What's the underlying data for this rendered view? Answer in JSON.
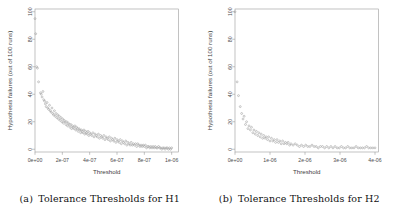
{
  "figure": {
    "panels": [
      {
        "id": "panel-h1",
        "caption_tag": "(a)",
        "caption_text": "Tolerance Thresholds for H1"
      },
      {
        "id": "panel-h2",
        "caption_tag": "(b)",
        "caption_text": "Tolerance Thresholds for H2"
      }
    ]
  },
  "chart_data": [
    {
      "type": "scatter",
      "title": "",
      "xlabel": "Threshold",
      "ylabel": "Hypothesis failures (out of 100 runs)",
      "xlim": [
        0,
        1.05e-06
      ],
      "ylim": [
        -2,
        102
      ],
      "grid": false,
      "legend": null,
      "xticks": [
        0,
        2e-07,
        4e-07,
        6e-07,
        8e-07,
        1e-06
      ],
      "xticklabels": [
        "0e+00",
        "2e-07",
        "4e-07",
        "6e-07",
        "8e-07",
        "1e-06"
      ],
      "yticks": [
        0,
        20,
        40,
        60,
        80,
        100
      ],
      "yticklabels": [
        "0",
        "20",
        "40",
        "60",
        "80",
        "100"
      ],
      "marker": "open-circle",
      "marker_color": "#9c9c9c",
      "points": [
        [
          0.0,
          95
        ],
        [
          5e-09,
          84
        ],
        [
          1.2e-08,
          60
        ],
        [
          1.8e-08,
          59
        ],
        [
          2.6e-08,
          49
        ],
        [
          4e-08,
          41
        ],
        [
          4.6e-08,
          40
        ],
        [
          5.2e-08,
          38
        ],
        [
          5.8e-08,
          42
        ],
        [
          6.4e-08,
          36
        ],
        [
          7e-08,
          35
        ],
        [
          7.6e-08,
          33
        ],
        [
          8.2e-08,
          31
        ],
        [
          8.8e-08,
          34
        ],
        [
          9.4e-08,
          30
        ],
        [
          1e-07,
          29
        ],
        [
          1.06e-07,
          32
        ],
        [
          1.12e-07,
          28
        ],
        [
          1.18e-07,
          27
        ],
        [
          1.24e-07,
          30
        ],
        [
          1.3e-07,
          26
        ],
        [
          1.36e-07,
          25
        ],
        [
          1.42e-07,
          28
        ],
        [
          1.48e-07,
          24
        ],
        [
          1.54e-07,
          26
        ],
        [
          1.6e-07,
          23
        ],
        [
          1.66e-07,
          25
        ],
        [
          1.72e-07,
          22
        ],
        [
          1.78e-07,
          24
        ],
        [
          1.84e-07,
          21
        ],
        [
          1.9e-07,
          23
        ],
        [
          1.96e-07,
          20
        ],
        [
          2.02e-07,
          22
        ],
        [
          2.08e-07,
          19
        ],
        [
          2.14e-07,
          21
        ],
        [
          2.2e-07,
          20
        ],
        [
          2.26e-07,
          18
        ],
        [
          2.32e-07,
          20
        ],
        [
          2.38e-07,
          17
        ],
        [
          2.44e-07,
          19
        ],
        [
          2.5e-07,
          18
        ],
        [
          2.56e-07,
          16
        ],
        [
          2.62e-07,
          18
        ],
        [
          2.68e-07,
          15
        ],
        [
          2.74e-07,
          17
        ],
        [
          2.8e-07,
          16
        ],
        [
          2.86e-07,
          15
        ],
        [
          2.92e-07,
          17
        ],
        [
          2.98e-07,
          14
        ],
        [
          3.04e-07,
          16
        ],
        [
          3.1e-07,
          15
        ],
        [
          3.16e-07,
          13
        ],
        [
          3.22e-07,
          15
        ],
        [
          3.28e-07,
          14
        ],
        [
          3.34e-07,
          12
        ],
        [
          3.4e-07,
          14
        ],
        [
          3.46e-07,
          13
        ],
        [
          3.52e-07,
          12
        ],
        [
          3.58e-07,
          14
        ],
        [
          3.64e-07,
          11
        ],
        [
          3.7e-07,
          13
        ],
        [
          3.76e-07,
          12
        ],
        [
          3.82e-07,
          11
        ],
        [
          3.88e-07,
          13
        ],
        [
          3.94e-07,
          10
        ],
        [
          4e-07,
          12
        ],
        [
          4.08e-07,
          11
        ],
        [
          4.16e-07,
          10
        ],
        [
          4.24e-07,
          12
        ],
        [
          4.32e-07,
          9
        ],
        [
          4.4e-07,
          11
        ],
        [
          4.48e-07,
          10
        ],
        [
          4.56e-07,
          9
        ],
        [
          4.64e-07,
          11
        ],
        [
          4.72e-07,
          8
        ],
        [
          4.8e-07,
          10
        ],
        [
          4.88e-07,
          9
        ],
        [
          4.96e-07,
          8
        ],
        [
          5.04e-07,
          10
        ],
        [
          5.12e-07,
          7
        ],
        [
          5.2e-07,
          9
        ],
        [
          5.28e-07,
          8
        ],
        [
          5.36e-07,
          7
        ],
        [
          5.44e-07,
          9
        ],
        [
          5.52e-07,
          6
        ],
        [
          5.6e-07,
          8
        ],
        [
          5.68e-07,
          7
        ],
        [
          5.76e-07,
          6
        ],
        [
          5.84e-07,
          8
        ],
        [
          5.92e-07,
          5
        ],
        [
          6e-07,
          7
        ],
        [
          6.08e-07,
          6
        ],
        [
          6.16e-07,
          5
        ],
        [
          6.24e-07,
          7
        ],
        [
          6.32e-07,
          4
        ],
        [
          6.4e-07,
          6
        ],
        [
          6.48e-07,
          5
        ],
        [
          6.56e-07,
          4
        ],
        [
          6.64e-07,
          6
        ],
        [
          6.72e-07,
          3
        ],
        [
          6.8e-07,
          5
        ],
        [
          6.88e-07,
          4
        ],
        [
          6.96e-07,
          3
        ],
        [
          7.04e-07,
          5
        ],
        [
          7.12e-07,
          3
        ],
        [
          7.2e-07,
          4
        ],
        [
          7.28e-07,
          3
        ],
        [
          7.36e-07,
          4
        ],
        [
          7.44e-07,
          2
        ],
        [
          7.52e-07,
          4
        ],
        [
          7.6e-07,
          3
        ],
        [
          7.68e-07,
          2
        ],
        [
          7.76e-07,
          3
        ],
        [
          7.84e-07,
          2
        ],
        [
          7.92e-07,
          3
        ],
        [
          8e-07,
          2
        ],
        [
          8.08e-07,
          3
        ],
        [
          8.16e-07,
          1
        ],
        [
          8.24e-07,
          2
        ],
        [
          8.32e-07,
          2
        ],
        [
          8.4e-07,
          1
        ],
        [
          8.48e-07,
          2
        ],
        [
          8.56e-07,
          1
        ],
        [
          8.64e-07,
          2
        ],
        [
          8.72e-07,
          1
        ],
        [
          8.8e-07,
          2
        ],
        [
          8.88e-07,
          1
        ],
        [
          8.96e-07,
          1
        ],
        [
          9.04e-07,
          2
        ],
        [
          9.12e-07,
          1
        ],
        [
          9.2e-07,
          1
        ],
        [
          9.28e-07,
          0
        ],
        [
          9.36e-07,
          1
        ],
        [
          9.44e-07,
          1
        ],
        [
          9.52e-07,
          0
        ],
        [
          9.6e-07,
          1
        ],
        [
          9.68e-07,
          1
        ],
        [
          9.76e-07,
          0
        ],
        [
          9.84e-07,
          1
        ],
        [
          9.92e-07,
          0
        ],
        [
          1e-06,
          1
        ]
      ]
    },
    {
      "type": "scatter",
      "title": "",
      "xlabel": "Threshold",
      "ylabel": "Hypothesis failures (out of 100 runs)",
      "xlim": [
        0,
        4.1e-06
      ],
      "ylim": [
        -2,
        102
      ],
      "grid": false,
      "legend": null,
      "xticks": [
        0,
        1e-06,
        2e-06,
        3e-06,
        4e-06
      ],
      "xticklabels": [
        "0e+00",
        "1e-06",
        "2e-06",
        "3e-06",
        "4e-06"
      ],
      "yticks": [
        0,
        20,
        40,
        60,
        80,
        100
      ],
      "yticklabels": [
        "0",
        "20",
        "40",
        "60",
        "80",
        "100"
      ],
      "marker": "open-circle",
      "marker_color": "#9c9c9c",
      "points": [
        [
          0.0,
          100
        ],
        [
          6e-08,
          49
        ],
        [
          1e-07,
          39
        ],
        [
          1.5e-07,
          31
        ],
        [
          1.9e-07,
          26
        ],
        [
          2.3e-07,
          22
        ],
        [
          2.6e-07,
          24
        ],
        [
          3e-07,
          18
        ],
        [
          3.3e-07,
          20
        ],
        [
          3.7e-07,
          15
        ],
        [
          4e-07,
          17
        ],
        [
          4.4e-07,
          14
        ],
        [
          4.7e-07,
          16
        ],
        [
          5.1e-07,
          12
        ],
        [
          5.4e-07,
          14
        ],
        [
          5.8e-07,
          11
        ],
        [
          6.1e-07,
          13
        ],
        [
          6.5e-07,
          10
        ],
        [
          6.8e-07,
          12
        ],
        [
          7.2e-07,
          9
        ],
        [
          7.5e-07,
          11
        ],
        [
          7.9e-07,
          8
        ],
        [
          8.2e-07,
          10
        ],
        [
          8.6e-07,
          8
        ],
        [
          8.9e-07,
          9
        ],
        [
          9.3e-07,
          7
        ],
        [
          9.6e-07,
          9
        ],
        [
          1e-06,
          6
        ],
        [
          1.04e-06,
          8
        ],
        [
          1.08e-06,
          6
        ],
        [
          1.12e-06,
          7
        ],
        [
          1.16e-06,
          5
        ],
        [
          1.2e-06,
          7
        ],
        [
          1.24e-06,
          5
        ],
        [
          1.28e-06,
          6
        ],
        [
          1.32e-06,
          4
        ],
        [
          1.36e-06,
          6
        ],
        [
          1.4e-06,
          4
        ],
        [
          1.44e-06,
          5
        ],
        [
          1.48e-06,
          4
        ],
        [
          1.52e-06,
          5
        ],
        [
          1.56e-06,
          3
        ],
        [
          1.6e-06,
          4
        ],
        [
          1.66e-06,
          3
        ],
        [
          1.72e-06,
          4
        ],
        [
          1.78e-06,
          3
        ],
        [
          1.84e-06,
          2
        ],
        [
          1.9e-06,
          3
        ],
        [
          1.96e-06,
          2
        ],
        [
          2.02e-06,
          3
        ],
        [
          2.08e-06,
          2
        ],
        [
          2.14e-06,
          2
        ],
        [
          2.2e-06,
          3
        ],
        [
          2.26e-06,
          2
        ],
        [
          2.32e-06,
          2
        ],
        [
          2.38e-06,
          1
        ],
        [
          2.44e-06,
          2
        ],
        [
          2.5e-06,
          2
        ],
        [
          2.56e-06,
          1
        ],
        [
          2.62e-06,
          2
        ],
        [
          2.68e-06,
          1
        ],
        [
          2.74e-06,
          2
        ],
        [
          2.8e-06,
          1
        ],
        [
          2.86e-06,
          2
        ],
        [
          2.92e-06,
          1
        ],
        [
          2.98e-06,
          1
        ],
        [
          3.04e-06,
          2
        ],
        [
          3.1e-06,
          1
        ],
        [
          3.16e-06,
          1
        ],
        [
          3.22e-06,
          2
        ],
        [
          3.28e-06,
          1
        ],
        [
          3.34e-06,
          1
        ],
        [
          3.4e-06,
          1
        ],
        [
          3.46e-06,
          2
        ],
        [
          3.52e-06,
          1
        ],
        [
          3.58e-06,
          1
        ],
        [
          3.64e-06,
          1
        ],
        [
          3.7e-06,
          1
        ],
        [
          3.76e-06,
          2
        ],
        [
          3.82e-06,
          1
        ],
        [
          3.88e-06,
          1
        ],
        [
          3.94e-06,
          1
        ],
        [
          4e-06,
          1
        ]
      ]
    }
  ]
}
